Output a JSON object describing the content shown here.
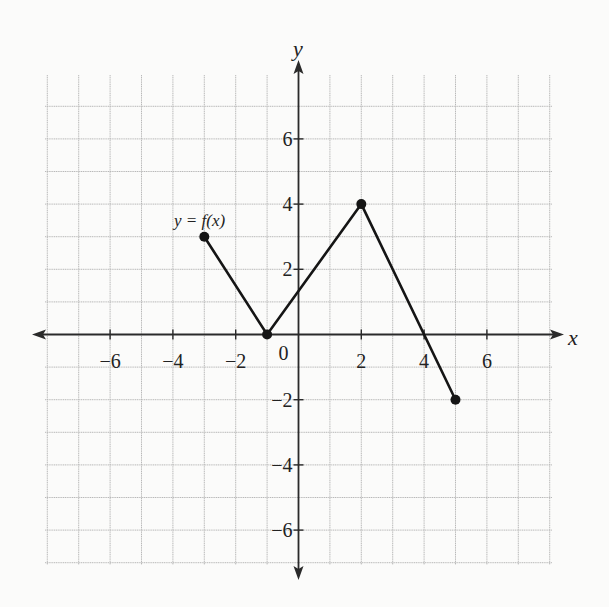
{
  "chart_data": {
    "type": "line",
    "title": "",
    "function_label": "y = f(x)",
    "xlabel": "x",
    "ylabel": "y",
    "xlim": [
      -8,
      8
    ],
    "ylim": [
      -7,
      7
    ],
    "grid": true,
    "x_ticks": [
      -6,
      -4,
      -2,
      0,
      2,
      4,
      6
    ],
    "x_tick_labels": [
      "−6",
      "−4",
      "−2",
      "0",
      "2",
      "4",
      "6"
    ],
    "y_ticks": [
      6,
      4,
      2,
      -2,
      -4,
      -6
    ],
    "y_tick_labels": [
      "6",
      "4",
      "2",
      "−2",
      "−4",
      "−6"
    ],
    "series": [
      {
        "name": "y = f(x)",
        "x": [
          -3,
          -1,
          2,
          5
        ],
        "y": [
          3,
          0,
          4,
          -2
        ],
        "endpoints_closed": true
      }
    ]
  },
  "labels": {
    "function": "y = f(x)",
    "x_axis": "x",
    "y_axis": "y",
    "origin": "0"
  },
  "colors": {
    "background": "#fbfbfa",
    "grid": "#b9b9b9",
    "axis": "#2a2a2a",
    "curve": "#151515"
  }
}
